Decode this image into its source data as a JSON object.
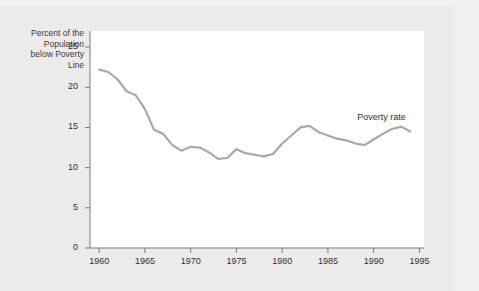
{
  "chart_data": {
    "type": "line",
    "title": "",
    "xlabel": "",
    "ylabel": "Percent of the\nPopulation\nbelow Poverty\nLine",
    "ylabel_lines": [
      "Percent of the",
      "Population",
      "below Poverty",
      "Line"
    ],
    "xlim": [
      1959,
      1995.5
    ],
    "ylim": [
      0,
      27
    ],
    "grid": false,
    "legend_position": "inline-annotation",
    "xticks": [
      1960,
      1965,
      1970,
      1975,
      1980,
      1985,
      1990,
      1995
    ],
    "xtick_labels": [
      "1960",
      "1965",
      "1970",
      "1975",
      "1980",
      "1985",
      "1990",
      "1995"
    ],
    "yticks": [
      0,
      5,
      10,
      15,
      20,
      25
    ],
    "ytick_labels": [
      "0",
      "5",
      "10",
      "15",
      "20",
      "25"
    ],
    "series": [
      {
        "name": "Poverty rate",
        "annotation": "Poverty rate",
        "color": "#a9a9a9",
        "x": [
          1960,
          1961,
          1962,
          1963,
          1964,
          1965,
          1966,
          1967,
          1968,
          1969,
          1970,
          1971,
          1972,
          1973,
          1974,
          1975,
          1976,
          1977,
          1978,
          1979,
          1980,
          1981,
          1982,
          1983,
          1984,
          1985,
          1986,
          1987,
          1988,
          1989,
          1990,
          1991,
          1992,
          1993,
          1994
        ],
        "values": [
          22.2,
          21.9,
          21.0,
          19.5,
          19.0,
          17.3,
          14.7,
          14.2,
          12.8,
          12.1,
          12.6,
          12.5,
          11.9,
          11.1,
          11.2,
          12.3,
          11.8,
          11.6,
          11.4,
          11.7,
          13.0,
          14.0,
          15.0,
          15.2,
          14.4,
          14.0,
          13.6,
          13.4,
          13.0,
          12.8,
          13.5,
          14.2,
          14.8,
          15.1,
          14.5
        ]
      }
    ]
  },
  "annotations": {
    "series_label": "Poverty rate"
  }
}
